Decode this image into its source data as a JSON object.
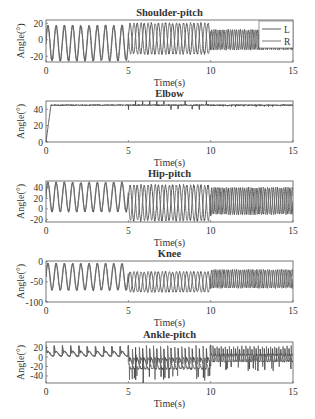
{
  "chart_data": [
    {
      "type": "line",
      "title": "Shoulder-pitch",
      "xlabel": "Time(s)",
      "ylabel": "Angle(°)",
      "xlim": [
        0,
        15
      ],
      "ylim": [
        -27,
        24
      ],
      "xticks": [
        0,
        5,
        10,
        15
      ],
      "yticks": [
        20,
        0,
        -20
      ],
      "legend": {
        "position": "upper right",
        "entries": [
          "L",
          "R"
        ]
      },
      "series": [
        {
          "name": "L",
          "segments": [
            {
              "t": [
                0,
                5
              ],
              "period": 0.5,
              "min": -25,
              "max": 17
            },
            {
              "t": [
                5,
                10
              ],
              "period": 0.43,
              "min": -17,
              "max": 20
            },
            {
              "t": [
                10,
                15
              ],
              "period": 0.25,
              "min": -12,
              "max": 12
            }
          ]
        },
        {
          "name": "R",
          "segments": [
            {
              "t": [
                0,
                5
              ],
              "period": 0.5,
              "min": -25,
              "max": 17
            },
            {
              "t": [
                5,
                10
              ],
              "period": 0.43,
              "min": -17,
              "max": 20
            },
            {
              "t": [
                10,
                15
              ],
              "period": 0.25,
              "min": -12,
              "max": 12
            }
          ]
        }
      ]
    },
    {
      "type": "line",
      "title": "Elbow",
      "xlabel": "Time(s)",
      "ylabel": "Angle(°)",
      "xlim": [
        0,
        15
      ],
      "ylim": [
        0,
        50
      ],
      "xticks": [
        0,
        5,
        10,
        15
      ],
      "yticks": [
        40,
        20,
        0
      ],
      "series": [
        {
          "name": "L",
          "steady_value": 45,
          "rise_time": 0.3,
          "spikes_between": [
            5,
            10
          ],
          "spike_amplitude": 5
        }
      ]
    },
    {
      "type": "line",
      "title": "Hip-pitch",
      "xlabel": "Time(s)",
      "ylabel": "Angle(°)",
      "xlim": [
        0,
        15
      ],
      "ylim": [
        -25,
        53
      ],
      "xticks": [
        0,
        5,
        10,
        15
      ],
      "yticks": [
        40,
        20,
        0,
        -20
      ],
      "series": [
        {
          "name": "L",
          "segments": [
            {
              "t": [
                0,
                5
              ],
              "period": 0.5,
              "min": -5,
              "max": 50
            },
            {
              "t": [
                5,
                10
              ],
              "period": 0.43,
              "min": -22,
              "max": 45
            },
            {
              "t": [
                10,
                15
              ],
              "period": 0.25,
              "min": -10,
              "max": 40
            }
          ]
        },
        {
          "name": "R",
          "segments": [
            {
              "t": [
                0,
                5
              ],
              "period": 0.5,
              "min": -5,
              "max": 50
            },
            {
              "t": [
                5,
                10
              ],
              "period": 0.43,
              "min": -22,
              "max": 45
            },
            {
              "t": [
                10,
                15
              ],
              "period": 0.25,
              "min": -10,
              "max": 40
            }
          ]
        }
      ]
    },
    {
      "type": "line",
      "title": "Knee",
      "xlabel": "Time(s)",
      "ylabel": "Angle(°)",
      "xlim": [
        0,
        15
      ],
      "ylim": [
        -100,
        2
      ],
      "xticks": [
        0,
        5,
        10,
        15
      ],
      "yticks": [
        0,
        -50,
        -100
      ],
      "series": [
        {
          "name": "L",
          "segments": [
            {
              "t": [
                0,
                5
              ],
              "period": 0.5,
              "min": -70,
              "max": -5
            },
            {
              "t": [
                5,
                10
              ],
              "period": 0.43,
              "min": -75,
              "max": -25
            },
            {
              "t": [
                10,
                15
              ],
              "period": 0.25,
              "min": -65,
              "max": -20
            }
          ]
        },
        {
          "name": "R",
          "segments": [
            {
              "t": [
                0,
                5
              ],
              "period": 0.5,
              "min": -70,
              "max": -5
            },
            {
              "t": [
                5,
                10
              ],
              "period": 0.43,
              "min": -75,
              "max": -25
            },
            {
              "t": [
                10,
                15
              ],
              "period": 0.25,
              "min": -65,
              "max": -20
            }
          ]
        }
      ]
    },
    {
      "type": "line",
      "title": "Ankle-pitch",
      "xlabel": "Time(s)",
      "ylabel": "Angle(°)",
      "xlim": [
        0,
        15
      ],
      "ylim": [
        -55,
        32
      ],
      "xticks": [
        0,
        5,
        10,
        15
      ],
      "yticks": [
        20,
        0,
        -20,
        -40
      ],
      "series": [
        {
          "name": "L",
          "segments": [
            {
              "t": [
                0,
                5
              ],
              "period": 0.5,
              "min": -5,
              "max": 25
            },
            {
              "t": [
                5,
                10
              ],
              "period": 0.43,
              "min": -40,
              "max": 25
            },
            {
              "t": [
                10,
                15
              ],
              "period": 0.25,
              "min": -20,
              "max": 25
            }
          ],
          "notable_min": {
            "t": 5.9,
            "value": -55
          }
        },
        {
          "name": "R",
          "segments": [
            {
              "t": [
                0,
                5
              ],
              "period": 0.5,
              "min": -5,
              "max": 25
            },
            {
              "t": [
                5,
                10
              ],
              "period": 0.43,
              "min": -40,
              "max": 25
            },
            {
              "t": [
                10,
                15
              ],
              "period": 0.25,
              "min": -20,
              "max": 25
            }
          ]
        }
      ]
    }
  ]
}
